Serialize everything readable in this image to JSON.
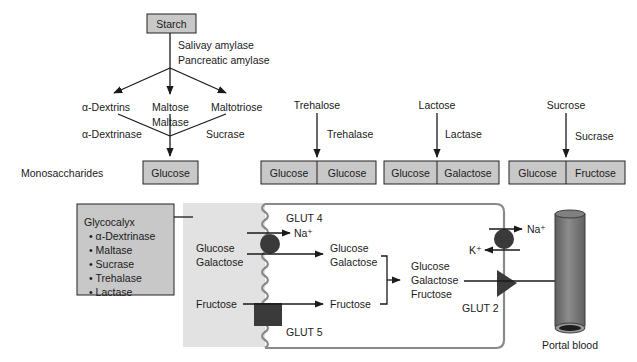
{
  "diagram": {
    "starch_pathway": {
      "source": "Starch",
      "enzymes": [
        "Salivay amylase",
        "Pancreatic amylase"
      ],
      "products": [
        "α-Dextrins",
        "Maltose",
        "Maltotriose"
      ],
      "secondary_enzymes": {
        "dextrins": "α-Dextrinase",
        "maltose": "Maltase",
        "maltotriose": "Sucrase"
      },
      "end_product": "Glucose"
    },
    "row_label": "Monosaccharides",
    "disaccharides": [
      {
        "name": "Trehalose",
        "enzyme": "Trehalase",
        "products": [
          "Glucose",
          "Glucose"
        ]
      },
      {
        "name": "Lactose",
        "enzyme": "Lactase",
        "products": [
          "Glucose",
          "Galactose"
        ]
      },
      {
        "name": "Sucrose",
        "enzyme": "Sucrase",
        "products": [
          "Glucose",
          "Fructose"
        ]
      }
    ],
    "glycocalyx": {
      "title": "Glycocalyx",
      "bullet": "•",
      "items": [
        "α-Dextrinase",
        "Maltase",
        "Sucrase",
        "Trehalase",
        "Lactase"
      ]
    },
    "enterocyte": {
      "lumen_inputs": {
        "glucose": "Glucose",
        "galactose": "Galactose",
        "fructose": "Fructose"
      },
      "transporters": {
        "apical_sglt": "GLUT 4",
        "apical_fructose": "GLUT 5",
        "basolateral": "GLUT 2"
      },
      "ions": {
        "na_apical": "Na⁺",
        "na_basal": "Na⁺",
        "k_basal": "K⁺"
      },
      "intracellular": {
        "glucose": "Glucose",
        "galactose": "Galactose",
        "fructose": "Fructose"
      },
      "merged": [
        "Glucose",
        "Galactose",
        "Fructose"
      ]
    },
    "vessel": {
      "label": "Portal blood"
    },
    "colors": {
      "box_fill": "#c8c8c8",
      "lumen_fill": "#e2e2e2",
      "membrane": "#8a8a8a",
      "transporter": "#3a3a3a",
      "vessel": "#7a7a7a"
    }
  }
}
